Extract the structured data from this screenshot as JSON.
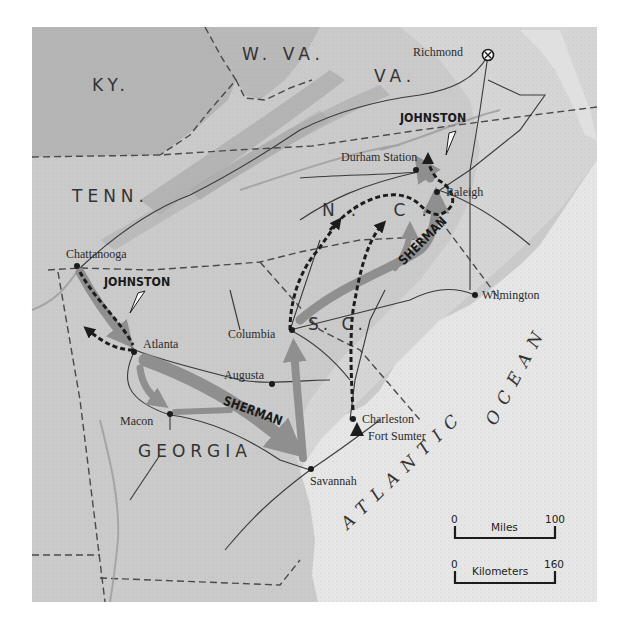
{
  "map": {
    "title": "Sherman's campaign against Johnston, Chattanooga to Durham Station",
    "colors": {
      "land_inland": "#b9b9b9",
      "land_south": "#cbcbcb",
      "coastal_plain": "#d8d8d8",
      "ocean": "#e7e7e7",
      "sherman_route": "#8f8f8f",
      "johnston_route": "#1c1c1c",
      "railroad": "#3a3a3a",
      "border": "#4a4a4a"
    },
    "states": [
      {
        "id": "ky",
        "label": "KY."
      },
      {
        "id": "wva",
        "label": "W. VA."
      },
      {
        "id": "va",
        "label": "VA."
      },
      {
        "id": "tenn",
        "label": "TENN."
      },
      {
        "id": "nc",
        "label": "N. C."
      },
      {
        "id": "sc",
        "label": "S. C."
      },
      {
        "id": "georgia",
        "label": "GEORGIA"
      }
    ],
    "cities": [
      {
        "id": "richmond",
        "label": "Richmond",
        "marker": "capital-star"
      },
      {
        "id": "durham-station",
        "label": "Durham Station",
        "marker": "dot"
      },
      {
        "id": "raleigh",
        "label": "Raleigh",
        "marker": "dot"
      },
      {
        "id": "chattanooga",
        "label": "Chattanooga",
        "marker": "dot"
      },
      {
        "id": "wilmington",
        "label": "Wilmington",
        "marker": "dot"
      },
      {
        "id": "columbia",
        "label": "Columbia",
        "marker": "dot"
      },
      {
        "id": "atlanta",
        "label": "Atlanta",
        "marker": "dot"
      },
      {
        "id": "augusta",
        "label": "Augusta",
        "marker": "dot"
      },
      {
        "id": "macon",
        "label": "Macon",
        "marker": "dot"
      },
      {
        "id": "charleston",
        "label": "Charleston",
        "marker": "dot"
      },
      {
        "id": "fort-sumter",
        "label": "Fort Sumter",
        "marker": "triangle"
      },
      {
        "id": "savannah",
        "label": "Savannah",
        "marker": "dot"
      }
    ],
    "armies": [
      {
        "id": "johnston-north",
        "label": "JOHNSTON",
        "route_style": "dashed-black"
      },
      {
        "id": "johnston-south",
        "label": "JOHNSTON",
        "route_style": "dashed-black"
      },
      {
        "id": "sherman-georgia",
        "label": "SHERMAN",
        "route_style": "solid-gray"
      },
      {
        "id": "sherman-carolinas",
        "label": "SHERMAN",
        "route_style": "solid-gray"
      }
    ],
    "water": {
      "ocean_label": "ATLANTIC OCEAN",
      "ocean_word1": "ATLANTIC",
      "ocean_word2": "OCEAN"
    },
    "scale": {
      "miles": {
        "label": "Miles",
        "min": "0",
        "max": "100"
      },
      "kilometers": {
        "label": "Kilometers",
        "min": "0",
        "max": "160"
      }
    }
  }
}
